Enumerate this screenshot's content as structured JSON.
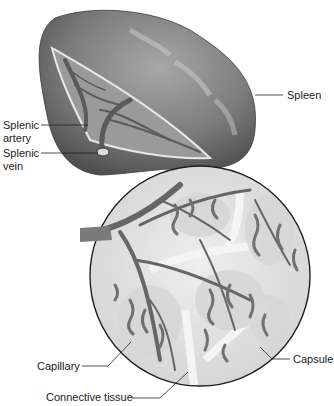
{
  "figure": {
    "labels": {
      "spleen": "Spleen",
      "splenic_artery_1": "Splenic",
      "splenic_artery_2": "artery",
      "splenic_vein_1": "Splenic",
      "splenic_vein_2": "vein",
      "capillary": "Capillary",
      "connective_tissue": "Connective tissue",
      "capsule": "Capsule"
    }
  },
  "colors": {
    "organ_dark": "#5e5e5e",
    "organ_mid": "#8a8a8a",
    "organ_light": "#b8b8b8",
    "vessel": "#6a6a6a",
    "inset_bg": "#e6e6e6",
    "leader_line": "#222222"
  }
}
